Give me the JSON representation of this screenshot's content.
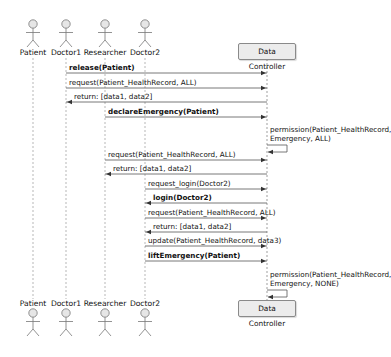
{
  "participants": {
    "actors": [
      {
        "name": "Patient",
        "x": 33
      },
      {
        "name": "Doctor1",
        "x": 66
      },
      {
        "name": "Researcher",
        "x": 105
      },
      {
        "name": "Doctor2",
        "x": 145
      }
    ],
    "controller": {
      "name": "Data Controller",
      "x": 267
    }
  },
  "messages": [
    {
      "label": "release(Patient)",
      "from": 66,
      "to": 267,
      "y": 73,
      "bold": true,
      "dashed": false
    },
    {
      "label": "request(Patient_HealthRecord, ALL)",
      "from": 66,
      "to": 267,
      "y": 88,
      "bold": false,
      "dashed": false
    },
    {
      "label": "return: [data1, data2]",
      "from": 267,
      "to": 66,
      "y": 102,
      "bold": false,
      "dashed": false
    },
    {
      "label": "declareEmergency(Patient)",
      "from": 105,
      "to": 267,
      "y": 117,
      "bold": true,
      "dashed": false
    },
    {
      "label": "request(Patient_HealthRecord, ALL)",
      "from": 105,
      "to": 267,
      "y": 160,
      "bold": false,
      "dashed": false
    },
    {
      "label": "return: [data1, data2]",
      "from": 267,
      "to": 105,
      "y": 174,
      "bold": false,
      "dashed": false
    },
    {
      "label": "request_login(Doctor2)",
      "from": 145,
      "to": 267,
      "y": 189,
      "bold": false,
      "dashed": false
    },
    {
      "label": "login(Doctor2)",
      "from": 267,
      "to": 145,
      "y": 203,
      "bold": true,
      "dashed": false
    },
    {
      "label": "request(Patient_HealthRecord, ALL)",
      "from": 145,
      "to": 267,
      "y": 218,
      "bold": false,
      "dashed": false
    },
    {
      "label": "return: [data1, data2]",
      "from": 267,
      "to": 145,
      "y": 232,
      "bold": false,
      "dashed": false
    },
    {
      "label": "update(Patient_HealthRecord, data3)",
      "from": 145,
      "to": 267,
      "y": 246,
      "bold": false,
      "dashed": false
    },
    {
      "label": "liftEmergency(Patient)",
      "from": 145,
      "to": 267,
      "y": 261,
      "bold": true,
      "dashed": false
    }
  ],
  "self_messages": [
    {
      "lines": [
        "permission(Patient_HealthRecord,",
        "Emergency, ALL)"
      ],
      "y": 125
    },
    {
      "lines": [
        "permission(Patient_HealthRecord,",
        "Emergency, NONE)"
      ],
      "y": 270
    }
  ]
}
